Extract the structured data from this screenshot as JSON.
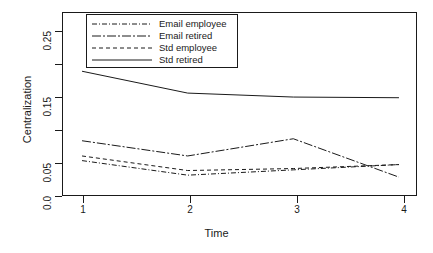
{
  "chart_data": {
    "type": "line",
    "title": "",
    "xlabel": "Time",
    "ylabel": "Centralization",
    "x": [
      1,
      2,
      3,
      4
    ],
    "xtick_labels": [
      "1",
      "2",
      "3",
      "4"
    ],
    "ytick_values": [
      0.0,
      0.05,
      0.1,
      0.15,
      0.2,
      0.25
    ],
    "ytick_labels": [
      "0.0",
      "0.05",
      "",
      "0.15",
      "",
      "0.25"
    ],
    "xlim": [
      0.82,
      4.18
    ],
    "ylim": [
      0.0,
      0.278
    ],
    "grid": false,
    "legend_position": "top-left-inside",
    "series": [
      {
        "name": "Email employee",
        "values": [
          0.055,
          0.033,
          0.041,
          0.049
        ],
        "linestyle": "dash-dot",
        "color": "#1a1a1a"
      },
      {
        "name": "Email retired",
        "values": [
          0.085,
          0.062,
          0.088,
          0.03
        ],
        "linestyle": "dash-dot-long",
        "color": "#1a1a1a"
      },
      {
        "name": "Std employee",
        "values": [
          0.062,
          0.04,
          0.043,
          0.049
        ],
        "linestyle": "dashed",
        "color": "#1a1a1a"
      },
      {
        "name": "Std retired",
        "values": [
          0.19,
          0.157,
          0.151,
          0.15
        ],
        "linestyle": "solid",
        "color": "#1a1a1a"
      }
    ]
  },
  "axes": {
    "x_title": "Time",
    "y_title": "Centralization"
  },
  "legend": {
    "entries": [
      {
        "label": "Email employee"
      },
      {
        "label": "Email retired"
      },
      {
        "label": "Std employee"
      },
      {
        "label": "Std retired"
      }
    ]
  },
  "ticks": {
    "x": [
      "1",
      "2",
      "3",
      "4"
    ],
    "y": [
      "0.0",
      "0.05",
      "0.15",
      "0.25"
    ]
  }
}
